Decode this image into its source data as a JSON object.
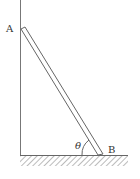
{
  "diagram": {
    "title": "",
    "labels": {
      "top_end": "A",
      "bottom_end": "B",
      "angle": "θ"
    },
    "elements": {
      "wall": "vertical wall line",
      "ground": "horizontal ground with hatching",
      "ladder": "rod leaning against wall from A to B",
      "angle_arc": "angle between rod and ground"
    },
    "colors": {
      "line": "#666666",
      "text": "#333333",
      "background": "#ffffff"
    }
  }
}
